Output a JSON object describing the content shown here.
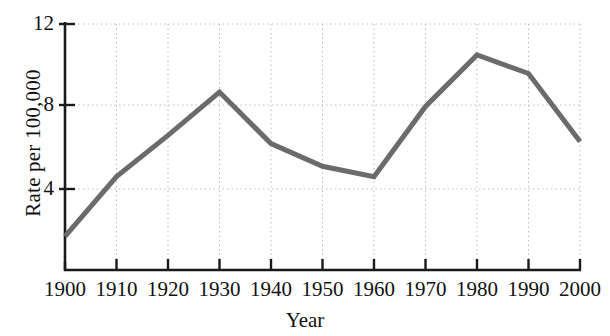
{
  "chart_data": {
    "type": "line",
    "title": "",
    "xlabel": "Year",
    "ylabel": "Rate per 100,000",
    "x": [
      1900,
      1910,
      1920,
      1930,
      1940,
      1950,
      1960,
      1970,
      1980,
      1990,
      2000
    ],
    "values": [
      1.7,
      4.6,
      6.6,
      8.7,
      6.2,
      5.1,
      4.6,
      8.0,
      10.5,
      9.6,
      6.3
    ],
    "xtick_labels": [
      "1900",
      "1910",
      "1920",
      "1930",
      "1940",
      "1950",
      "1960",
      "1970",
      "1980",
      "1990",
      "2000"
    ],
    "ytick_labels": [
      "4",
      "8",
      "12"
    ],
    "yticks": [
      4,
      8,
      12
    ],
    "xlim": [
      1900,
      2000
    ],
    "ylim": [
      0,
      12
    ],
    "grid": true,
    "grid_style": "dotted",
    "legend": null,
    "series_color": "#6b6b6b",
    "axis_color": "#1a1a1a",
    "grid_color": "#bdbdbd",
    "line_width": 5
  }
}
